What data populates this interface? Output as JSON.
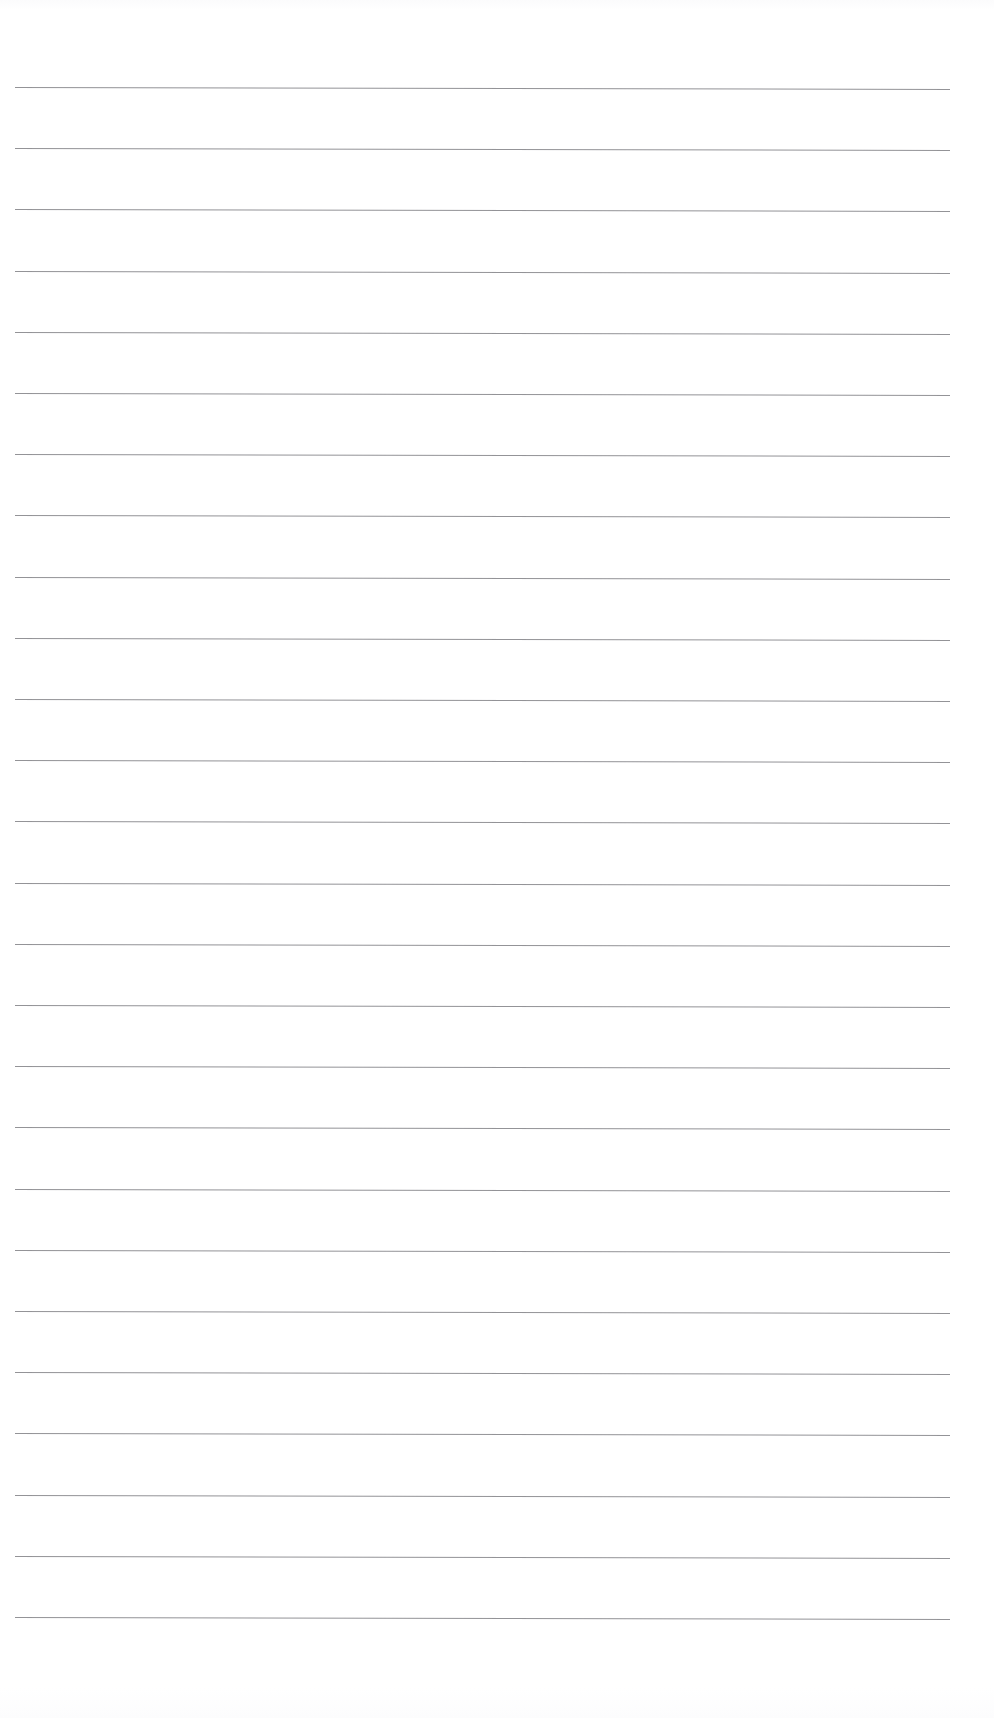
{
  "document": {
    "kind": "scanned-blank-ruled-page",
    "title": "Blank Ruled Notepad Page",
    "page_width": 994,
    "page_height": 1718,
    "background_color": "#ffffff",
    "has_text_content": false,
    "visible_text": "",
    "notes": "Scan of an empty lined writing page; no headings, no handwriting, no printed words, no page number, no margin rule."
  },
  "ruling": {
    "line_color": "#8a8a8e",
    "line_thickness_px": 1,
    "line_count": 26,
    "left_x": 15,
    "right_x": 950,
    "line_length_px": 935,
    "first_line_y": 87,
    "last_line_y": 1617,
    "line_spacing_px": 61.2,
    "skew_deg": 0.12,
    "top_margin_px": 87,
    "bottom_margin_px": 101,
    "lines_y": [
      87,
      148.2,
      209.4,
      270.6,
      331.8,
      393,
      454.2,
      515.4,
      576.6,
      637.8,
      699,
      760.2,
      821.4,
      882.6,
      943.8,
      1005,
      1066.2,
      1127.4,
      1188.6,
      1249.8,
      1311,
      1372.2,
      1433.4,
      1494.6,
      1555.8,
      1617
    ]
  }
}
